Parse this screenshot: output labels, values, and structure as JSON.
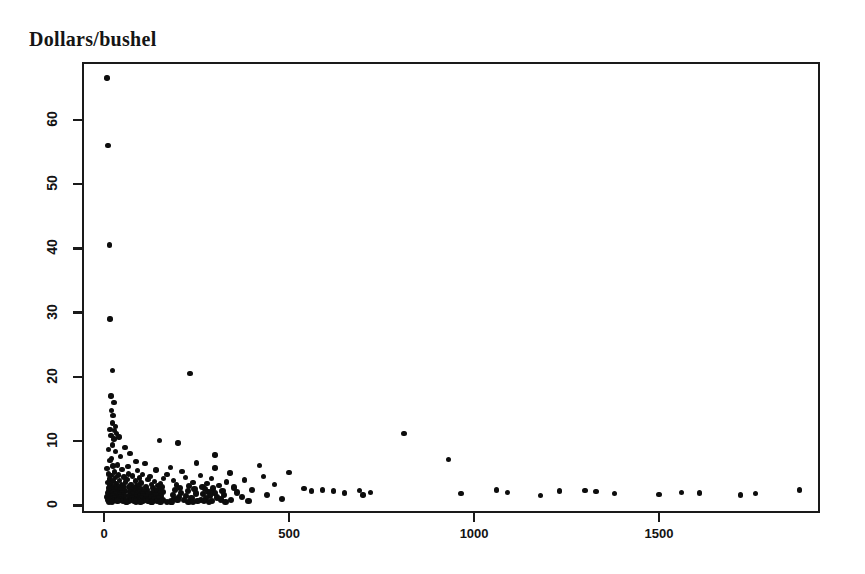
{
  "chart_data": {
    "type": "scatter",
    "title": "Dollars/bushel",
    "xlabel": "",
    "ylabel": "Dollars/bushel",
    "xlim": [
      -60,
      1935
    ],
    "ylim": [
      -1.2,
      69
    ],
    "grid": false,
    "legend": null,
    "x_ticks": [
      0,
      500,
      1000,
      1500
    ],
    "x_tick_labels": [
      "0",
      "500",
      "1000",
      "1500"
    ],
    "y_ticks": [
      0,
      10,
      20,
      30,
      40,
      50,
      60
    ],
    "y_tick_labels": [
      "0",
      "10",
      "20",
      "30",
      "40",
      "50",
      "60"
    ],
    "y_tick_labels_rotated": true,
    "marker": "filled-circle",
    "marker_color": "#0d0d0d",
    "points": [
      [
        8,
        66.5
      ],
      [
        10,
        56.0
      ],
      [
        14,
        40.5
      ],
      [
        16,
        29.0
      ],
      [
        22,
        21.0
      ],
      [
        232,
        20.5
      ],
      [
        18,
        17.0
      ],
      [
        26,
        16.0
      ],
      [
        20,
        14.8
      ],
      [
        24,
        14.0
      ],
      [
        22,
        12.8
      ],
      [
        30,
        12.3
      ],
      [
        16,
        11.8
      ],
      [
        28,
        11.6
      ],
      [
        34,
        11.2
      ],
      [
        810,
        11.2
      ],
      [
        18,
        10.9
      ],
      [
        40,
        10.6
      ],
      [
        26,
        10.3
      ],
      [
        150,
        10.1
      ],
      [
        200,
        9.7
      ],
      [
        22,
        9.4
      ],
      [
        56,
        9.0
      ],
      [
        12,
        8.7
      ],
      [
        30,
        8.4
      ],
      [
        70,
        8.1
      ],
      [
        300,
        7.8
      ],
      [
        44,
        7.6
      ],
      [
        20,
        7.3
      ],
      [
        930,
        7.1
      ],
      [
        16,
        7.0
      ],
      [
        86,
        6.8
      ],
      [
        250,
        6.6
      ],
      [
        110,
        6.5
      ],
      [
        36,
        6.3
      ],
      [
        420,
        6.2
      ],
      [
        24,
        6.1
      ],
      [
        64,
        6.0
      ],
      [
        180,
        5.9
      ],
      [
        300,
        5.8
      ],
      [
        8,
        5.7
      ],
      [
        48,
        5.6
      ],
      [
        140,
        5.5
      ],
      [
        90,
        5.4
      ],
      [
        210,
        5.3
      ],
      [
        28,
        5.2
      ],
      [
        500,
        5.1
      ],
      [
        340,
        5.0
      ],
      [
        66,
        4.9
      ],
      [
        12,
        4.85
      ],
      [
        104,
        4.8
      ],
      [
        170,
        4.75
      ],
      [
        38,
        4.7
      ],
      [
        260,
        4.65
      ],
      [
        18,
        4.6
      ],
      [
        76,
        4.55
      ],
      [
        124,
        4.5
      ],
      [
        430,
        4.45
      ],
      [
        54,
        4.4
      ],
      [
        220,
        4.35
      ],
      [
        30,
        4.3
      ],
      [
        96,
        4.25
      ],
      [
        160,
        4.2
      ],
      [
        290,
        4.15
      ],
      [
        14,
        4.1
      ],
      [
        62,
        4.05
      ],
      [
        118,
        4.0
      ],
      [
        380,
        3.95
      ],
      [
        42,
        3.9
      ],
      [
        188,
        3.85
      ],
      [
        24,
        3.8
      ],
      [
        84,
        3.75
      ],
      [
        136,
        3.7
      ],
      [
        330,
        3.65
      ],
      [
        58,
        3.6
      ],
      [
        240,
        3.55
      ],
      [
        10,
        3.5
      ],
      [
        100,
        3.45
      ],
      [
        152,
        3.4
      ],
      [
        278,
        3.35
      ],
      [
        34,
        3.3
      ],
      [
        72,
        3.28
      ],
      [
        128,
        3.25
      ],
      [
        460,
        3.2
      ],
      [
        46,
        3.18
      ],
      [
        196,
        3.15
      ],
      [
        20,
        3.12
      ],
      [
        88,
        3.1
      ],
      [
        144,
        3.08
      ],
      [
        310,
        3.05
      ],
      [
        52,
        3.0
      ],
      [
        230,
        2.98
      ],
      [
        16,
        2.95
      ],
      [
        92,
        2.92
      ],
      [
        156,
        2.9
      ],
      [
        266,
        2.88
      ],
      [
        28,
        2.85
      ],
      [
        68,
        2.82
      ],
      [
        112,
        2.8
      ],
      [
        350,
        2.78
      ],
      [
        40,
        2.75
      ],
      [
        204,
        2.72
      ],
      [
        12,
        2.7
      ],
      [
        80,
        2.68
      ],
      [
        132,
        2.65
      ],
      [
        294,
        2.62
      ],
      [
        50,
        2.6
      ],
      [
        244,
        2.58
      ],
      [
        22,
        2.55
      ],
      [
        98,
        2.52
      ],
      [
        148,
        2.5
      ],
      [
        272,
        2.48
      ],
      [
        36,
        2.45
      ],
      [
        74,
        2.42
      ],
      [
        116,
        2.4
      ],
      [
        400,
        2.38
      ],
      [
        44,
        2.35
      ],
      [
        192,
        2.32
      ],
      [
        18,
        2.3
      ],
      [
        86,
        2.28
      ],
      [
        140,
        2.25
      ],
      [
        320,
        2.22
      ],
      [
        56,
        2.2
      ],
      [
        226,
        2.18
      ],
      [
        14,
        2.15
      ],
      [
        94,
        2.12
      ],
      [
        158,
        2.1
      ],
      [
        282,
        2.08
      ],
      [
        26,
        2.05
      ],
      [
        70,
        2.03
      ],
      [
        108,
        2.0
      ],
      [
        360,
        1.98
      ],
      [
        38,
        1.96
      ],
      [
        208,
        1.94
      ],
      [
        10,
        1.92
      ],
      [
        82,
        1.9
      ],
      [
        130,
        1.88
      ],
      [
        298,
        1.86
      ],
      [
        48,
        1.84
      ],
      [
        248,
        1.82
      ],
      [
        20,
        1.8
      ],
      [
        102,
        1.78
      ],
      [
        150,
        1.76
      ],
      [
        268,
        1.74
      ],
      [
        32,
        1.72
      ],
      [
        78,
        1.7
      ],
      [
        120,
        1.68
      ],
      [
        440,
        1.66
      ],
      [
        42,
        1.64
      ],
      [
        186,
        1.62
      ],
      [
        16,
        1.6
      ],
      [
        90,
        1.58
      ],
      [
        138,
        1.56
      ],
      [
        324,
        1.54
      ],
      [
        54,
        1.52
      ],
      [
        222,
        1.5
      ],
      [
        12,
        1.48
      ],
      [
        96,
        1.46
      ],
      [
        154,
        1.44
      ],
      [
        286,
        1.42
      ],
      [
        24,
        1.4
      ],
      [
        66,
        1.38
      ],
      [
        106,
        1.36
      ],
      [
        372,
        1.34
      ],
      [
        34,
        1.32
      ],
      [
        202,
        1.3
      ],
      [
        8,
        1.28
      ],
      [
        84,
        1.26
      ],
      [
        126,
        1.24
      ],
      [
        306,
        1.22
      ],
      [
        46,
        1.2
      ],
      [
        236,
        1.18
      ],
      [
        18,
        1.16
      ],
      [
        100,
        1.14
      ],
      [
        146,
        1.12
      ],
      [
        276,
        1.1
      ],
      [
        30,
        1.08
      ],
      [
        76,
        1.06
      ],
      [
        114,
        1.04
      ],
      [
        480,
        1.02
      ],
      [
        40,
        1.0
      ],
      [
        190,
        0.98
      ],
      [
        14,
        0.96
      ],
      [
        88,
        0.94
      ],
      [
        134,
        0.92
      ],
      [
        316,
        0.9
      ],
      [
        52,
        0.88
      ],
      [
        216,
        0.86
      ],
      [
        10,
        0.85
      ],
      [
        92,
        0.84
      ],
      [
        160,
        0.83
      ],
      [
        262,
        0.82
      ],
      [
        26,
        0.81
      ],
      [
        72,
        0.8
      ],
      [
        110,
        0.79
      ],
      [
        342,
        0.78
      ],
      [
        44,
        0.77
      ],
      [
        198,
        0.76
      ],
      [
        20,
        0.75
      ],
      [
        80,
        0.74
      ],
      [
        122,
        0.73
      ],
      [
        292,
        0.72
      ],
      [
        50,
        0.71
      ],
      [
        252,
        0.7
      ],
      [
        16,
        0.69
      ],
      [
        104,
        0.68
      ],
      [
        142,
        0.67
      ],
      [
        270,
        0.66
      ],
      [
        36,
        0.65
      ],
      [
        68,
        0.64
      ],
      [
        118,
        0.63
      ],
      [
        390,
        0.62
      ],
      [
        58,
        0.61
      ],
      [
        182,
        0.6
      ],
      [
        12,
        0.59
      ],
      [
        86,
        0.58
      ],
      [
        128,
        0.57
      ],
      [
        328,
        0.56
      ],
      [
        62,
        0.55
      ],
      [
        228,
        0.54
      ],
      [
        22,
        0.53
      ],
      [
        98,
        0.52
      ],
      [
        152,
        0.51
      ],
      [
        284,
        0.5
      ],
      [
        60,
        0.49
      ],
      [
        130,
        0.48
      ],
      [
        170,
        0.47
      ],
      [
        240,
        0.46
      ],
      [
        540,
        2.6
      ],
      [
        560,
        2.2
      ],
      [
        590,
        2.4
      ],
      [
        620,
        2.2
      ],
      [
        650,
        1.9
      ],
      [
        690,
        2.3
      ],
      [
        700,
        1.6
      ],
      [
        720,
        2.0
      ],
      [
        965,
        1.8
      ],
      [
        1060,
        2.4
      ],
      [
        1090,
        2.0
      ],
      [
        1180,
        1.5
      ],
      [
        1230,
        2.2
      ],
      [
        1300,
        2.3
      ],
      [
        1330,
        2.1
      ],
      [
        1380,
        1.8
      ],
      [
        1500,
        1.7
      ],
      [
        1560,
        2.0
      ],
      [
        1610,
        1.9
      ],
      [
        1720,
        1.6
      ],
      [
        1760,
        1.8
      ],
      [
        1880,
        2.4
      ]
    ]
  },
  "axes": {
    "title_label": "Dollars/bushel",
    "y_labels": [
      "60",
      "50",
      "40",
      "30",
      "20",
      "10",
      "0"
    ],
    "x_labels": [
      "0",
      "500",
      "1000",
      "1500"
    ]
  }
}
